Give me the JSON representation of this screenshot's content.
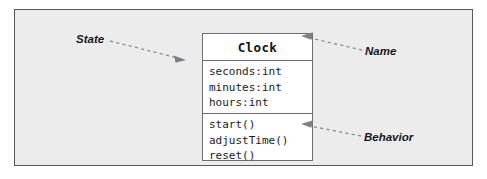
{
  "figure": {
    "kind": "uml-class-diagram",
    "background_color": "#ececed",
    "frame_border_color": "#55585c"
  },
  "class_box": {
    "name": "Clock",
    "border_color": "#6d7073",
    "fill_color": "#ffffff",
    "attributes": [
      "seconds:int",
      "minutes:int",
      "hours:int"
    ],
    "operations": [
      "start()",
      "adjustTime()",
      "reset()"
    ]
  },
  "annotations": [
    {
      "label": "State",
      "points_to": "attributes-compartment",
      "arrow_direction": "right"
    },
    {
      "label": "Name",
      "points_to": "class-name-compartment",
      "arrow_direction": "left"
    },
    {
      "label": "Behavior",
      "points_to": "operations-compartment",
      "arrow_direction": "left"
    }
  ],
  "leader_line": {
    "color": "#8b8e91",
    "style": "dashed",
    "arrowhead_color": "#7e8184"
  }
}
